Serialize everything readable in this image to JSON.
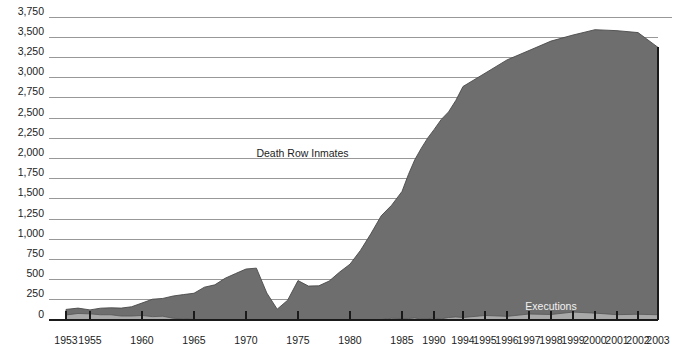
{
  "chart_data": {
    "type": "area",
    "title": "",
    "subtitle": "",
    "xlabel": "",
    "ylabel": "",
    "ylim": [
      0,
      3750
    ],
    "y_tick_step": 250,
    "grid": true,
    "legend_position": "inline-annotation",
    "x_tick_labels": [
      "1953",
      "1955",
      "1960",
      "1965",
      "1970",
      "1975",
      "1980",
      "1985",
      "1990",
      "1994",
      "1995",
      "1996",
      "1997",
      "1998",
      "1999",
      "2000",
      "2001",
      "2002",
      "2003"
    ],
    "y_tick_labels": [
      "0",
      "250",
      "500",
      "750",
      "1,000",
      "1,250",
      "1,500",
      "1,750",
      "2,000",
      "2,250",
      "2,500",
      "2,750",
      "3,000",
      "3,250",
      "3,500",
      "3,750"
    ],
    "y_tick_values": [
      0,
      250,
      500,
      750,
      1000,
      1250,
      1500,
      1750,
      2000,
      2250,
      2500,
      2750,
      3000,
      3250,
      3500,
      3750
    ],
    "annotations": [
      {
        "name": "death-row-inmates-label",
        "text": "Death Row Inmates",
        "x_year": 1971,
        "y_value": 2020
      },
      {
        "name": "executions-label",
        "text": "Executions",
        "x_year": 1998,
        "y_value": 125
      }
    ],
    "colors": {
      "death_row_fill": "#6e6e6e",
      "executions_fill": "#a9a9a9",
      "gridline": "#8d8d8d",
      "axis": "#1a1a1a",
      "background": "#ffffff",
      "dark_label_text": "#1c1c1c",
      "light_label_text": "#f2f2f2"
    },
    "series": [
      {
        "name": "Death Row Inmates",
        "fill": "#6e6e6e",
        "x": [
          1953,
          1954,
          1955,
          1956,
          1957,
          1958,
          1959,
          1960,
          1961,
          1962,
          1963,
          1964,
          1965,
          1966,
          1967,
          1968,
          1969,
          1970,
          1971,
          1972,
          1973,
          1974,
          1975,
          1976,
          1977,
          1978,
          1979,
          1980,
          1981,
          1982,
          1983,
          1984,
          1985,
          1986,
          1987,
          1988,
          1989,
          1990,
          1991,
          1992,
          1993,
          1994,
          1995,
          1996,
          1997,
          1998,
          1999,
          2000,
          2001,
          2002,
          2003
        ],
        "values": [
          131,
          147,
          125,
          146,
          151,
          147,
          164,
          210,
          257,
          267,
          297,
          315,
          331,
          406,
          435,
          517,
          575,
          631,
          642,
          334,
          134,
          244,
          488,
          420,
          423,
          482,
          593,
          691,
          860,
          1066,
          1289,
          1420,
          1591,
          1800,
          1984,
          2124,
          2250,
          2356,
          2482,
          2575,
          2716,
          2890,
          3054,
          3219,
          3335,
          3452,
          3527,
          3593,
          3581,
          3557,
          3374
        ],
        "notes": "Annual year-end death row population; near-zero trough in 1973 following Furman v. Georgia (1972)"
      },
      {
        "name": "Executions",
        "fill": "#a9a9a9",
        "x": [
          1953,
          1954,
          1955,
          1956,
          1957,
          1958,
          1959,
          1960,
          1961,
          1962,
          1963,
          1964,
          1965,
          1966,
          1967,
          1968,
          1969,
          1970,
          1971,
          1972,
          1973,
          1974,
          1975,
          1976,
          1977,
          1978,
          1979,
          1980,
          1981,
          1982,
          1983,
          1984,
          1985,
          1986,
          1987,
          1988,
          1989,
          1990,
          1991,
          1992,
          1993,
          1994,
          1995,
          1996,
          1997,
          1998,
          1999,
          2000,
          2001,
          2002,
          2003
        ],
        "values": [
          62,
          81,
          76,
          65,
          65,
          49,
          49,
          56,
          42,
          47,
          21,
          15,
          7,
          1,
          2,
          0,
          0,
          0,
          0,
          0,
          0,
          0,
          0,
          0,
          1,
          0,
          2,
          0,
          1,
          2,
          5,
          21,
          18,
          18,
          25,
          11,
          16,
          23,
          14,
          31,
          38,
          31,
          56,
          45,
          74,
          68,
          98,
          85,
          66,
          71,
          65
        ],
        "notes": "Annual executions carried out in the United States"
      }
    ]
  }
}
